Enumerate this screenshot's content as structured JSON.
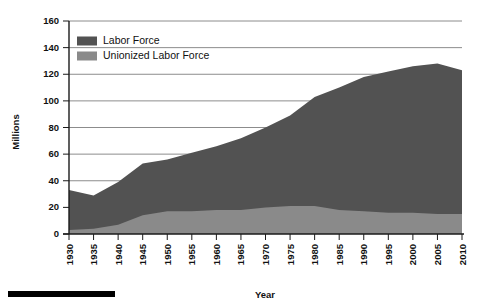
{
  "chart_data": {
    "type": "area",
    "title": "",
    "xlabel": "Year",
    "ylabel": "Millions",
    "xlim": [
      1930,
      2010
    ],
    "ylim": [
      0,
      160
    ],
    "grid": true,
    "legend_position": "top-left",
    "x": [
      1930,
      1935,
      1940,
      1945,
      1950,
      1955,
      1960,
      1965,
      1970,
      1975,
      1980,
      1985,
      1990,
      1995,
      2000,
      2005,
      2010
    ],
    "xtick_labels": [
      "1930",
      "1935",
      "1940",
      "1945",
      "1950",
      "1955",
      "1960",
      "1965",
      "1970",
      "1975",
      "1980",
      "1985",
      "1990",
      "1995",
      "2000",
      "2005",
      "2010"
    ],
    "ytick_labels": [
      "0",
      "20",
      "40",
      "60",
      "80",
      "100",
      "120",
      "140",
      "160"
    ],
    "ytick_values": [
      0,
      20,
      40,
      60,
      80,
      100,
      120,
      140,
      160
    ],
    "series": [
      {
        "name": "Labor Force",
        "color": "#525252",
        "values": [
          33,
          29,
          39,
          53,
          56,
          61,
          66,
          72,
          80,
          89,
          103,
          110,
          118,
          122,
          126,
          128,
          123
        ]
      },
      {
        "name": "Unionized Labor Force",
        "color": "#8a8a8a",
        "values": [
          3,
          4,
          7,
          14,
          17,
          17,
          18,
          18,
          20,
          21,
          21,
          18,
          17,
          16,
          16,
          15,
          15
        ]
      }
    ]
  },
  "legend": {
    "items": [
      {
        "label": "Labor Force",
        "color": "#525252"
      },
      {
        "label": "Unionized Labor Force",
        "color": "#8a8a8a"
      }
    ]
  },
  "axes": {
    "y_title": "Millions",
    "x_title": "Year"
  },
  "footer": {
    "rule_color": "#000000"
  }
}
